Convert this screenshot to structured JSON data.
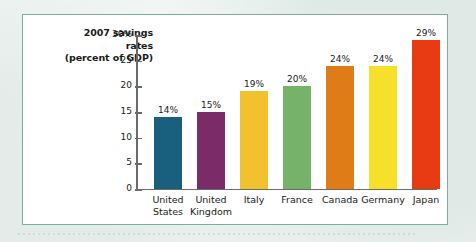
{
  "chart_data": {
    "type": "bar",
    "title": "2007 savings rates (percent of GDP)",
    "title_lines": [
      "2007 savings",
      "rates",
      "(percent of GDP)"
    ],
    "xlabel": "",
    "ylabel": "",
    "ylim": [
      0,
      30
    ],
    "grid": false,
    "legend": "none",
    "y_ticks": [
      {
        "value": 30,
        "label": "30%"
      },
      {
        "value": 25,
        "label": "25"
      },
      {
        "value": 20,
        "label": "20"
      },
      {
        "value": 15,
        "label": "15"
      },
      {
        "value": 10,
        "label": "10"
      },
      {
        "value": 5,
        "label": "5"
      },
      {
        "value": 0,
        "label": "0"
      }
    ],
    "categories": [
      "United States",
      "United Kingdom",
      "Italy",
      "France",
      "Canada",
      "Germany",
      "Japan"
    ],
    "category_lines": [
      [
        "United",
        "States"
      ],
      [
        "United",
        "Kingdom"
      ],
      [
        "Italy",
        ""
      ],
      [
        "France",
        ""
      ],
      [
        "Canada",
        ""
      ],
      [
        "Germany",
        ""
      ],
      [
        "Japan",
        ""
      ]
    ],
    "values": [
      14,
      15,
      19,
      20,
      24,
      24,
      29
    ],
    "data_labels": [
      "14%",
      "15%",
      "19%",
      "20%",
      "24%",
      "24%",
      "29%"
    ],
    "bar_colors": [
      "#19607f",
      "#7a2b68",
      "#f2c12e",
      "#76b26a",
      "#e07c18",
      "#f6e02a",
      "#e83b14"
    ]
  },
  "frame": {
    "border_color": "#7fad9c",
    "panel_color": "#ffffff",
    "page_color": "#eef3f1",
    "axis_color": "#6b6b6b"
  }
}
